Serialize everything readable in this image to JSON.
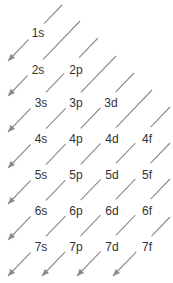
{
  "colors": {
    "line": "#8a8a8a",
    "text": "#333333"
  },
  "orbitals": [
    {
      "label": "1s",
      "x": 38,
      "y": 33
    },
    {
      "label": "2s",
      "x": 38,
      "y": 70
    },
    {
      "label": "2p",
      "x": 76,
      "y": 70
    },
    {
      "label": "3s",
      "x": 41,
      "y": 103
    },
    {
      "label": "3p",
      "x": 76,
      "y": 103
    },
    {
      "label": "3d",
      "x": 111,
      "y": 103
    },
    {
      "label": "4s",
      "x": 41,
      "y": 139
    },
    {
      "label": "4p",
      "x": 76,
      "y": 139
    },
    {
      "label": "4d",
      "x": 112,
      "y": 139
    },
    {
      "label": "4f",
      "x": 147,
      "y": 139
    },
    {
      "label": "5s",
      "x": 41,
      "y": 175
    },
    {
      "label": "5p",
      "x": 76,
      "y": 175
    },
    {
      "label": "5d",
      "x": 112,
      "y": 175
    },
    {
      "label": "5f",
      "x": 147,
      "y": 175
    },
    {
      "label": "6s",
      "x": 41,
      "y": 211
    },
    {
      "label": "6p",
      "x": 76,
      "y": 211
    },
    {
      "label": "6d",
      "x": 112,
      "y": 211
    },
    {
      "label": "6f",
      "x": 147,
      "y": 211
    },
    {
      "label": "7s",
      "x": 41,
      "y": 247
    },
    {
      "label": "7p",
      "x": 76,
      "y": 247
    },
    {
      "label": "7d",
      "x": 112,
      "y": 247
    },
    {
      "label": "7f",
      "x": 147,
      "y": 247
    }
  ],
  "diagonals": [
    {
      "order": 1,
      "path": "1s"
    },
    {
      "order": 2,
      "path": "2s"
    },
    {
      "order": 3,
      "path": "2p → 3s"
    },
    {
      "order": 4,
      "path": "3p → 4s"
    },
    {
      "order": 5,
      "path": "3d → 4p → 5s"
    },
    {
      "order": 6,
      "path": "4d → 5p → 6s"
    },
    {
      "order": 7,
      "path": "4f → 5d → 6p → 7s"
    },
    {
      "order": 8,
      "path": "5f → 6d → 7p"
    },
    {
      "order": 9,
      "path": "6f → 7d"
    },
    {
      "order": 10,
      "path": "7f"
    }
  ]
}
